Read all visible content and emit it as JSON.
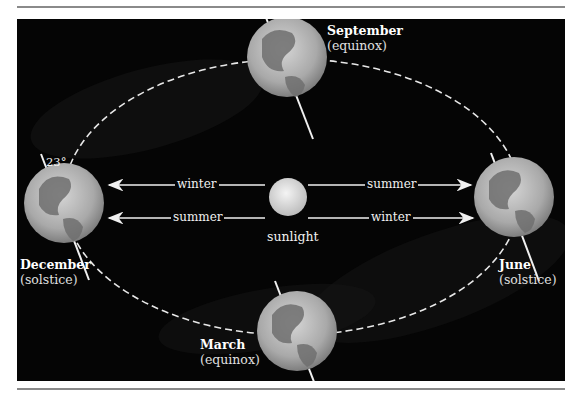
{
  "figure": {
    "tilt_label": "23°",
    "sun_label": "sunlight",
    "positions": [
      {
        "id": "september",
        "name": "September",
        "event": "(equinox)"
      },
      {
        "id": "december",
        "name": "December",
        "event": "(solstice)"
      },
      {
        "id": "june",
        "name": "June",
        "event": "(solstice)"
      },
      {
        "id": "march",
        "name": "March",
        "event": "(equinox)"
      }
    ],
    "arrows": {
      "left_top": "winter",
      "left_bottom": "summer",
      "right_top": "summer",
      "right_bottom": "winter"
    },
    "colors": {
      "background": "#050505",
      "orbit": "#e8e8e8",
      "globe_light": "#c9c9c9",
      "globe_dark": "#6f6f6f",
      "sun": "#e6e6e6",
      "rule": "#8a8a8a"
    }
  }
}
